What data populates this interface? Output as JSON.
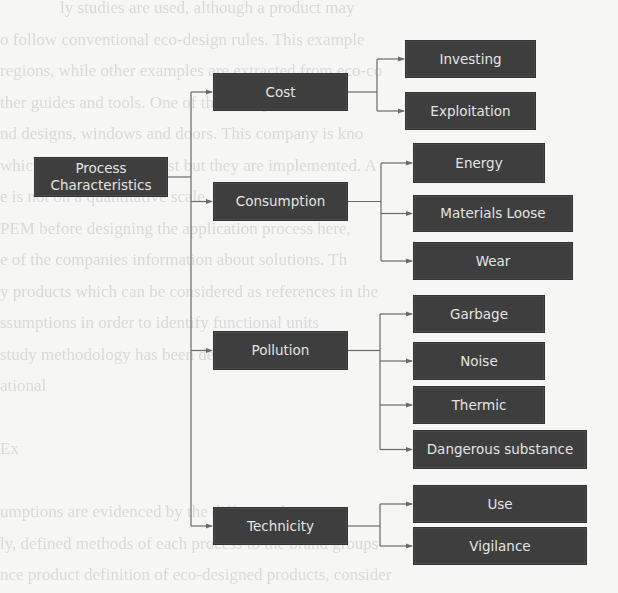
{
  "diagram": {
    "root": {
      "id": "process",
      "label": "Process\nCharacteristics",
      "x": 34,
      "y": 157,
      "w": 134,
      "h": 40
    },
    "categories": [
      {
        "id": "cost",
        "label": "Cost",
        "x": 213,
        "y": 73,
        "w": 135,
        "h": 38,
        "branch_x": 377
      },
      {
        "id": "consumption",
        "label": "Consumption",
        "x": 213,
        "y": 182,
        "w": 135,
        "h": 39,
        "branch_x": 381
      },
      {
        "id": "pollution",
        "label": "Pollution",
        "x": 213,
        "y": 331,
        "w": 135,
        "h": 39,
        "branch_x": 380
      },
      {
        "id": "technicity",
        "label": "Technicity",
        "x": 213,
        "y": 507,
        "w": 135,
        "h": 38,
        "branch_x": 380
      }
    ],
    "leaves": [
      {
        "id": "investing",
        "parent": "cost",
        "label": "Investing",
        "x": 405,
        "y": 40,
        "w": 131,
        "h": 38
      },
      {
        "id": "exploitation",
        "parent": "cost",
        "label": "Exploitation",
        "x": 405,
        "y": 92,
        "w": 131,
        "h": 38
      },
      {
        "id": "energy",
        "parent": "consumption",
        "label": "Energy",
        "x": 413,
        "y": 143,
        "w": 132,
        "h": 40
      },
      {
        "id": "materials-loose",
        "parent": "consumption",
        "label": "Materials Loose",
        "x": 413,
        "y": 195,
        "w": 160,
        "h": 37
      },
      {
        "id": "wear",
        "parent": "consumption",
        "label": "Wear",
        "x": 413,
        "y": 242,
        "w": 160,
        "h": 38
      },
      {
        "id": "garbage",
        "parent": "pollution",
        "label": "Garbage",
        "x": 413,
        "y": 295,
        "w": 132,
        "h": 38
      },
      {
        "id": "noise",
        "parent": "pollution",
        "label": "Noise",
        "x": 413,
        "y": 342,
        "w": 132,
        "h": 38
      },
      {
        "id": "thermic",
        "parent": "pollution",
        "label": "Thermic",
        "x": 413,
        "y": 386,
        "w": 132,
        "h": 38
      },
      {
        "id": "dangerous-substance",
        "parent": "pollution",
        "label": "Dangerous substance",
        "x": 413,
        "y": 430,
        "w": 174,
        "h": 39
      },
      {
        "id": "use",
        "parent": "technicity",
        "label": "Use",
        "x": 413,
        "y": 485,
        "w": 174,
        "h": 38
      },
      {
        "id": "vigilance",
        "parent": "technicity",
        "label": "Vigilance",
        "x": 413,
        "y": 527,
        "w": 174,
        "h": 38
      }
    ],
    "trunk_x": 191,
    "colors": {
      "box_fill": "#3e3e3e",
      "box_text": "#e4e4e4",
      "connector": "#6a6a6a",
      "background": "#f6f6f4"
    }
  },
  "background_text": [
    "ly studies are used, although a product may",
    "o follow conventional eco-design rules. This example",
    "regions, while other examples are extracted from eco-co",
    "ther guides and tools. One of the example on cor",
    "nd designs, windows and doors. This company is kno",
    "which are not legal almost but they are implemented. A",
    "e is not on a quantitative scale, exemplified with",
    "PEM before designing the application process here,",
    "e of the companies information about solutions. Th",
    "y products which can be considered as references in the",
    "ssumptions in order to identify functional units",
    "study methodology has been developed as well",
    "ational",
    "",
    "Ex",
    "",
    "umptions are evidenced by the different sheets",
    "ly, defined methods of each process to the brand groups",
    "nce product definition of eco-designed products, consider"
  ]
}
